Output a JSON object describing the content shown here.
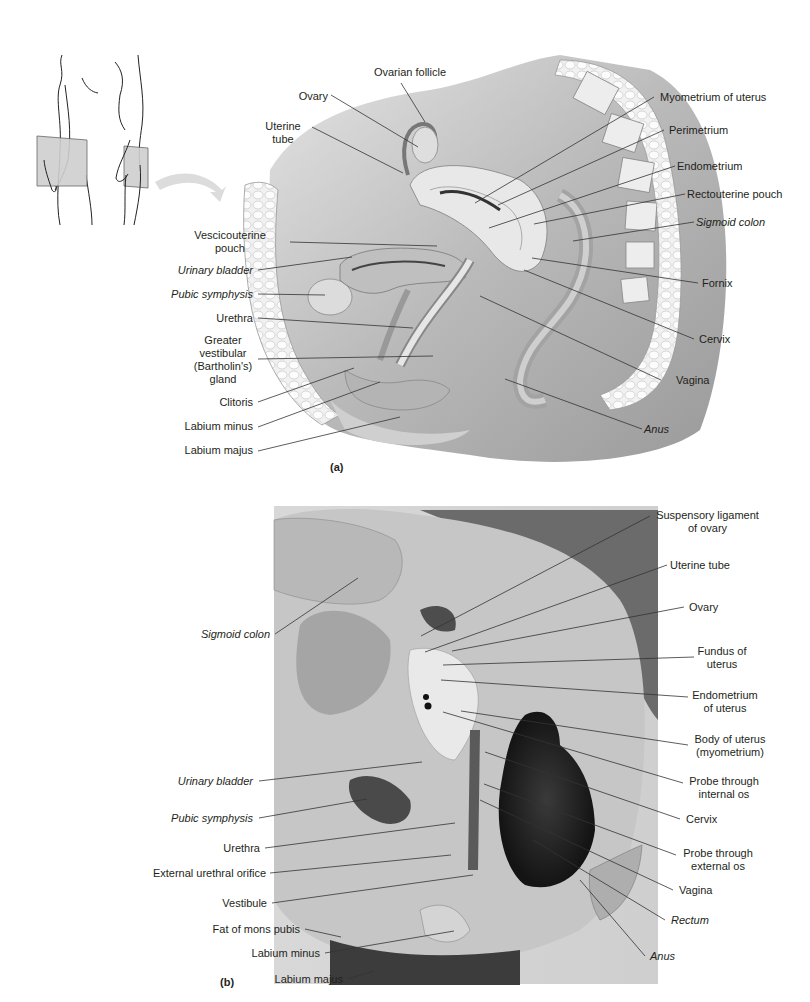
{
  "panel_a": {
    "letter": "(a)",
    "labels_left": [
      {
        "id": "uterine-tube",
        "text": "Uterine\ntube",
        "italic": false
      },
      {
        "id": "vescicouterine-pouch",
        "text": "Vescicouterine\npouch",
        "italic": false
      },
      {
        "id": "urinary-bladder",
        "text": "Urinary bladder",
        "italic": true
      },
      {
        "id": "pubic-symphysis",
        "text": "Pubic symphysis",
        "italic": true
      },
      {
        "id": "urethra",
        "text": "Urethra",
        "italic": false
      },
      {
        "id": "greater-vestibular-gland",
        "text": "Greater\nvestibular\n(Bartholin's)\ngland",
        "italic": false
      },
      {
        "id": "clitoris",
        "text": "Clitoris",
        "italic": false
      },
      {
        "id": "labium-minus",
        "text": "Labium minus",
        "italic": false
      },
      {
        "id": "labium-majus",
        "text": "Labium majus",
        "italic": false
      }
    ],
    "labels_top": [
      {
        "id": "ovarian-follicle",
        "text": "Ovarian follicle",
        "italic": false
      },
      {
        "id": "ovary",
        "text": "Ovary",
        "italic": false
      }
    ],
    "labels_right": [
      {
        "id": "myometrium-of-uterus",
        "text": "Myometrium of uterus",
        "italic": false
      },
      {
        "id": "perimetrium",
        "text": "Perimetrium",
        "italic": false
      },
      {
        "id": "endometrium",
        "text": "Endometrium",
        "italic": false
      },
      {
        "id": "rectouterine-pouch",
        "text": "Rectouterine pouch",
        "italic": false
      },
      {
        "id": "sigmoid-colon",
        "text": "Sigmoid colon",
        "italic": true
      },
      {
        "id": "fornix",
        "text": "Fornix",
        "italic": false
      },
      {
        "id": "cervix",
        "text": "Cervix",
        "italic": false
      },
      {
        "id": "vagina",
        "text": "Vagina",
        "italic": false
      },
      {
        "id": "anus",
        "text": "Anus",
        "italic": true
      }
    ]
  },
  "panel_b": {
    "letter": "(b)",
    "labels_left": [
      {
        "id": "sigmoid-colon",
        "text": "Sigmoid colon",
        "italic": true
      },
      {
        "id": "urinary-bladder",
        "text": "Urinary bladder",
        "italic": true
      },
      {
        "id": "pubic-symphysis",
        "text": "Pubic symphysis",
        "italic": true
      },
      {
        "id": "urethra",
        "text": "Urethra",
        "italic": false
      },
      {
        "id": "external-urethral-orifice",
        "text": "External urethral orifice",
        "italic": false
      },
      {
        "id": "vestibule",
        "text": "Vestibule",
        "italic": false
      },
      {
        "id": "fat-of-mons-pubis",
        "text": "Fat of mons pubis",
        "italic": false
      },
      {
        "id": "labium-minus",
        "text": "Labium minus",
        "italic": false
      },
      {
        "id": "labium-majus",
        "text": "Labium majus",
        "italic": false
      }
    ],
    "labels_right": [
      {
        "id": "suspensory-ligament-of-ovary",
        "text": "Suspensory ligament\nof ovary",
        "italic": false
      },
      {
        "id": "uterine-tube",
        "text": "Uterine tube",
        "italic": false
      },
      {
        "id": "ovary",
        "text": "Ovary",
        "italic": false
      },
      {
        "id": "fundus-of-uterus",
        "text": "Fundus of\nuterus",
        "italic": false
      },
      {
        "id": "endometrium-of-uterus",
        "text": "Endometrium\nof uterus",
        "italic": false
      },
      {
        "id": "body-of-uterus",
        "text": "Body of uterus\n(myometrium)",
        "italic": false
      },
      {
        "id": "probe-internal-os",
        "text": "Probe through\ninternal os",
        "italic": false
      },
      {
        "id": "cervix",
        "text": "Cervix",
        "italic": false
      },
      {
        "id": "probe-external-os",
        "text": "Probe through\nexternal os",
        "italic": false
      },
      {
        "id": "vagina",
        "text": "Vagina",
        "italic": false
      },
      {
        "id": "rectum",
        "text": "Rectum",
        "italic": true
      },
      {
        "id": "anus",
        "text": "Anus",
        "italic": true
      }
    ]
  },
  "colors": {
    "text": "#231f20",
    "leader": "#333333",
    "illustration_bg": "#c9c9c9",
    "tissue_light": "#e8e8e8",
    "photo_bg": "#a8a8a8",
    "orientation_plane": "#cfcfcf"
  }
}
